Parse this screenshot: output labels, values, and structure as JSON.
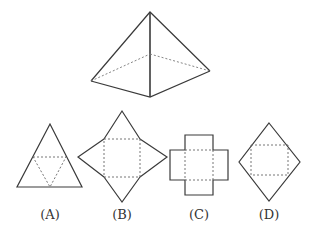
{
  "figure": {
    "pyramid": {
      "label": ""
    },
    "options": [
      {
        "id": "A",
        "label": "(A)",
        "shape": "triangle net"
      },
      {
        "id": "B",
        "label": "(B)",
        "shape": "square with four triangles"
      },
      {
        "id": "C",
        "label": "(C)",
        "shape": "cross of squares"
      },
      {
        "id": "D",
        "label": "(D)",
        "shape": "square with two triangles (diamond)"
      }
    ]
  },
  "colors": {
    "stroke": "#3a3a3a",
    "dashed": "#666666",
    "background": "#ffffff"
  }
}
